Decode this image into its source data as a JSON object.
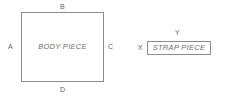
{
  "diagram": {
    "background_color": "#ffffff",
    "stroke_color": "#8c8c8c",
    "text_color": "#6e6e6e",
    "pieces": [
      {
        "id": "body-piece",
        "label": "BODY PIECE",
        "shape": "square",
        "edges": [
          {
            "id": "a",
            "label": "A",
            "position": "left"
          },
          {
            "id": "b",
            "label": "B",
            "position": "top"
          },
          {
            "id": "c",
            "label": "C",
            "position": "right"
          },
          {
            "id": "d",
            "label": "D",
            "position": "bottom"
          }
        ]
      },
      {
        "id": "strap-piece",
        "label": "STRAP PIECE",
        "shape": "rectangle",
        "edges": [
          {
            "id": "x",
            "label": "X",
            "position": "left"
          },
          {
            "id": "y",
            "label": "Y",
            "position": "top"
          }
        ]
      }
    ]
  }
}
